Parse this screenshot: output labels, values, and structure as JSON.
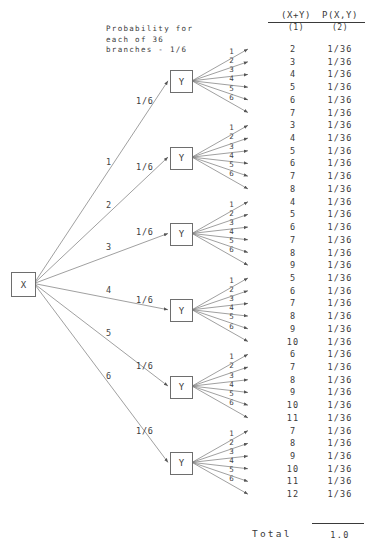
{
  "diagram": {
    "title_note": "Probability for\neach of 36\nbranches - 1/6",
    "note_lines": [
      "Probability for",
      "each of 36",
      "branches - 1/6"
    ],
    "root_node_label": "X",
    "second_node_label": "Y",
    "root_branch_prob_label": "1/6",
    "columns": {
      "sum_header": "(X+Y)",
      "sum_subheader": "(1)",
      "prob_header": "P(X,Y)",
      "prob_subheader": "(2)"
    },
    "total_label": "Total",
    "total_value": "1.0",
    "branch_prob": "1/36",
    "root_branch_labels": [
      "1",
      "2",
      "3",
      "4",
      "5",
      "6"
    ],
    "sub_branch_labels": [
      "1",
      "2",
      "3",
      "4",
      "5",
      "6"
    ],
    "groups": [
      {
        "x": "1",
        "prob": "1/6",
        "outcomes": [
          {
            "y": "1",
            "sum": "2",
            "p": "1/36"
          },
          {
            "y": "2",
            "sum": "3",
            "p": "1/36"
          },
          {
            "y": "3",
            "sum": "4",
            "p": "1/36"
          },
          {
            "y": "4",
            "sum": "5",
            "p": "1/36"
          },
          {
            "y": "5",
            "sum": "6",
            "p": "1/36"
          },
          {
            "y": "6",
            "sum": "7",
            "p": "1/36"
          }
        ]
      },
      {
        "x": "2",
        "prob": "1/6",
        "outcomes": [
          {
            "y": "1",
            "sum": "3",
            "p": "1/36"
          },
          {
            "y": "2",
            "sum": "4",
            "p": "1/36"
          },
          {
            "y": "3",
            "sum": "5",
            "p": "1/36"
          },
          {
            "y": "4",
            "sum": "6",
            "p": "1/36"
          },
          {
            "y": "5",
            "sum": "7",
            "p": "1/36"
          },
          {
            "y": "6",
            "sum": "8",
            "p": "1/36"
          }
        ]
      },
      {
        "x": "3",
        "prob": "1/6",
        "outcomes": [
          {
            "y": "1",
            "sum": "4",
            "p": "1/36"
          },
          {
            "y": "2",
            "sum": "5",
            "p": "1/36"
          },
          {
            "y": "3",
            "sum": "6",
            "p": "1/36"
          },
          {
            "y": "4",
            "sum": "7",
            "p": "1/36"
          },
          {
            "y": "5",
            "sum": "8",
            "p": "1/36"
          },
          {
            "y": "6",
            "sum": "9",
            "p": "1/36"
          }
        ]
      },
      {
        "x": "4",
        "prob": "1/6",
        "outcomes": [
          {
            "y": "1",
            "sum": "5",
            "p": "1/36"
          },
          {
            "y": "2",
            "sum": "6",
            "p": "1/36"
          },
          {
            "y": "3",
            "sum": "7",
            "p": "1/36"
          },
          {
            "y": "4",
            "sum": "8",
            "p": "1/36"
          },
          {
            "y": "5",
            "sum": "9",
            "p": "1/36"
          },
          {
            "y": "6",
            "sum": "10",
            "p": "1/36"
          }
        ]
      },
      {
        "x": "5",
        "prob": "1/6",
        "outcomes": [
          {
            "y": "1",
            "sum": "6",
            "p": "1/36"
          },
          {
            "y": "2",
            "sum": "7",
            "p": "1/36"
          },
          {
            "y": "3",
            "sum": "8",
            "p": "1/36"
          },
          {
            "y": "4",
            "sum": "9",
            "p": "1/36"
          },
          {
            "y": "5",
            "sum": "10",
            "p": "1/36"
          },
          {
            "y": "6",
            "sum": "11",
            "p": "1/36"
          }
        ]
      },
      {
        "x": "6",
        "prob": "1/6",
        "outcomes": [
          {
            "y": "1",
            "sum": "7",
            "p": "1/36"
          },
          {
            "y": "2",
            "sum": "8",
            "p": "1/36"
          },
          {
            "y": "3",
            "sum": "9",
            "p": "1/36"
          },
          {
            "y": "4",
            "sum": "10",
            "p": "1/36"
          },
          {
            "y": "5",
            "sum": "11",
            "p": "1/36"
          },
          {
            "y": "6",
            "sum": "12",
            "p": "1/36"
          }
        ]
      }
    ],
    "colors": {
      "ink": "#3a3a3a",
      "line": "#6e6e6e",
      "background": "#ffffff"
    }
  }
}
